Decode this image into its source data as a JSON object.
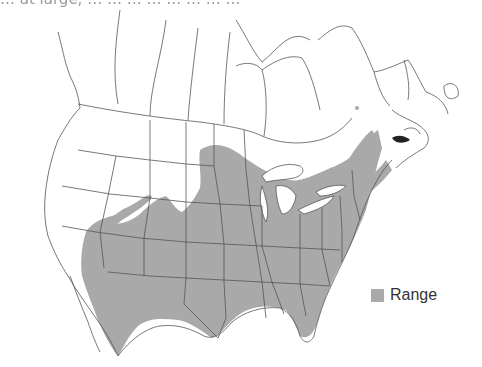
{
  "caption_fragment": "… at large, … … … … … … … …",
  "map": {
    "region": "North America (Canada, United States, northern Mexico)",
    "range_color": "#a9a9a9",
    "border_color": "#555555",
    "land_color": "#ffffff"
  },
  "legend": {
    "items": [
      {
        "label": "Range",
        "color": "#a9a9a9"
      }
    ]
  }
}
